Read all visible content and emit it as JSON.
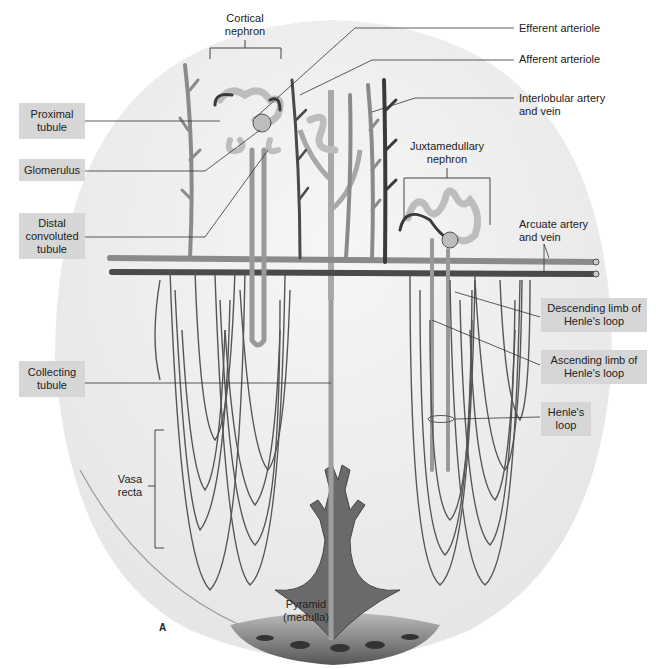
{
  "figure": {
    "panel_letter": "A"
  },
  "labels": {
    "left_boxed": [
      {
        "id": "proximal",
        "text": "Proximal tubule",
        "line1": "Proximal",
        "line2": "tubule"
      },
      {
        "id": "glomerulus",
        "text": "Glomerulus",
        "line1": "Glomerulus"
      },
      {
        "id": "distal",
        "text": "Distal convoluted tubule",
        "line1": "Distal",
        "line2": "convoluted",
        "line3": "tubule"
      },
      {
        "id": "collecting",
        "text": "Collecting tubule",
        "line1": "Collecting",
        "line2": "tubule"
      }
    ],
    "right_plain": [
      {
        "id": "efferent",
        "text": "Efferent arteriole"
      },
      {
        "id": "afferent",
        "text": "Afferent arteriole"
      },
      {
        "id": "interlobular",
        "line1": "Interlobular artery",
        "line2": "and vein"
      },
      {
        "id": "arcuate",
        "line1": "Arcuate artery",
        "line2": "and vein"
      }
    ],
    "right_boxed": [
      {
        "id": "descending",
        "line1": "Descending limb of",
        "line2": "Henle's loop"
      },
      {
        "id": "ascending",
        "line1": "Ascending limb of",
        "line2": "Henle's loop"
      },
      {
        "id": "henle",
        "line1": "Henle's",
        "line2": "loop"
      }
    ],
    "groups": {
      "cortical": {
        "line1": "Cortical",
        "line2": "nephron"
      },
      "juxtamedullary": {
        "line1": "Juxtamedullary",
        "line2": "nephron"
      },
      "vasa_recta": {
        "line1": "Vasa",
        "line2": "recta"
      },
      "pyramid": {
        "line1": "Pyramid",
        "line2": "(medulla)"
      }
    }
  },
  "colors": {
    "label_box": "#d6d6d6",
    "vessel_dark": "#3a3a3a",
    "vessel_mid": "#7a7a7a",
    "tubule_light": "#bdbdbd",
    "background_tissue": "#efefef",
    "leader_line": "#333333"
  }
}
